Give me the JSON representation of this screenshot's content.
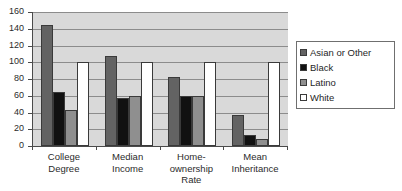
{
  "chart_data": {
    "type": "bar",
    "title": "",
    "subtitle": "",
    "xlabel": "",
    "ylabel": "",
    "ylim": [
      0,
      160
    ],
    "yticks": [
      0,
      20,
      40,
      60,
      80,
      100,
      120,
      140,
      160
    ],
    "ytick_labels": [
      "0",
      "20",
      "40",
      "60",
      "80",
      "100",
      "120",
      "140",
      "160"
    ],
    "grid": true,
    "legend_position": "right",
    "categories": [
      "College\nDegree",
      "Median\nIncome",
      "Home-\nownership\nRate",
      "Mean\nInheritance"
    ],
    "series": [
      {
        "name": "Asian or Other",
        "color": "#636363",
        "values": [
          144,
          108,
          82,
          37
        ]
      },
      {
        "name": "Black",
        "color": "#111111",
        "values": [
          64,
          57,
          60,
          13
        ]
      },
      {
        "name": "Latino",
        "color": "#8f8f8f",
        "values": [
          43,
          60,
          60,
          8
        ]
      },
      {
        "name": "White",
        "color": "#ffffff",
        "values": [
          100,
          100,
          100,
          100
        ]
      }
    ]
  },
  "legend": {
    "items": [
      {
        "label": "Asian or Other"
      },
      {
        "label": "Black"
      },
      {
        "label": "Latino"
      },
      {
        "label": "White"
      }
    ]
  },
  "colors": {
    "plot_background": "#d9d9d9",
    "gridline": "#8c8c8c",
    "axis": "#4a4a4a",
    "page_background": "#ffffff",
    "text": "#2b2b2b"
  }
}
